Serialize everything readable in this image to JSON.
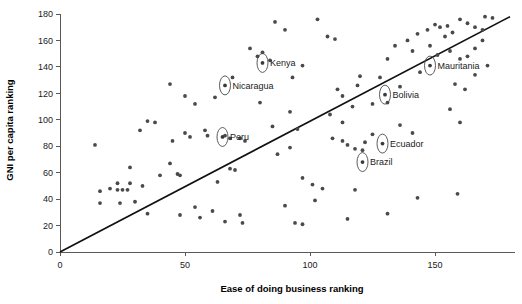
{
  "chart_data": {
    "type": "scatter",
    "title": "",
    "xlabel": "Ease of doing business ranking",
    "ylabel": "GNI per capita ranking",
    "xlim": [
      0,
      182
    ],
    "ylim": [
      0,
      180
    ],
    "xticks": [
      0,
      50,
      100,
      150
    ],
    "yticks": [
      0,
      20,
      40,
      60,
      80,
      100,
      120,
      140,
      160,
      180
    ],
    "grid": false,
    "legend": null,
    "marker_color": "#4a4a4a",
    "trendline": {
      "type": "linear",
      "x": [
        0,
        180
      ],
      "y": [
        0,
        178
      ],
      "color": "#111111"
    },
    "annotations": [
      {
        "label": "Kenya",
        "x": 81,
        "y": 143,
        "label_side": "right"
      },
      {
        "label": "Nicaragua",
        "x": 66,
        "y": 126,
        "label_side": "right"
      },
      {
        "label": "Peru",
        "x": 65,
        "y": 87,
        "label_side": "right"
      },
      {
        "label": "Mauritania",
        "x": 148,
        "y": 141,
        "label_side": "right"
      },
      {
        "label": "Bolivia",
        "x": 130,
        "y": 119,
        "label_side": "right"
      },
      {
        "label": "Ecuador",
        "x": 129,
        "y": 82,
        "label_side": "right"
      },
      {
        "label": "Brazil",
        "x": 121,
        "y": 68,
        "label_side": "right"
      }
    ],
    "points": [
      {
        "x": 16,
        "y": 46
      },
      {
        "x": 16,
        "y": 37
      },
      {
        "x": 14,
        "y": 81
      },
      {
        "x": 20,
        "y": 48
      },
      {
        "x": 23,
        "y": 47
      },
      {
        "x": 25,
        "y": 47
      },
      {
        "x": 27,
        "y": 47
      },
      {
        "x": 23,
        "y": 52
      },
      {
        "x": 28,
        "y": 52
      },
      {
        "x": 33,
        "y": 50
      },
      {
        "x": 24,
        "y": 37
      },
      {
        "x": 30,
        "y": 38
      },
      {
        "x": 35,
        "y": 29
      },
      {
        "x": 28,
        "y": 64
      },
      {
        "x": 32,
        "y": 92
      },
      {
        "x": 35,
        "y": 99
      },
      {
        "x": 38,
        "y": 98
      },
      {
        "x": 40,
        "y": 58
      },
      {
        "x": 44,
        "y": 67
      },
      {
        "x": 45,
        "y": 84
      },
      {
        "x": 47,
        "y": 59
      },
      {
        "x": 48,
        "y": 58
      },
      {
        "x": 44,
        "y": 127
      },
      {
        "x": 50,
        "y": 90
      },
      {
        "x": 52,
        "y": 87
      },
      {
        "x": 50,
        "y": 118
      },
      {
        "x": 54,
        "y": 112
      },
      {
        "x": 48,
        "y": 28
      },
      {
        "x": 54,
        "y": 34
      },
      {
        "x": 56,
        "y": 26
      },
      {
        "x": 58,
        "y": 92
      },
      {
        "x": 59,
        "y": 88
      },
      {
        "x": 62,
        "y": 117
      },
      {
        "x": 61,
        "y": 31
      },
      {
        "x": 63,
        "y": 53
      },
      {
        "x": 68,
        "y": 63
      },
      {
        "x": 70,
        "y": 62
      },
      {
        "x": 66,
        "y": 88
      },
      {
        "x": 68,
        "y": 86
      },
      {
        "x": 69,
        "y": 132
      },
      {
        "x": 72,
        "y": 86
      },
      {
        "x": 74,
        "y": 84
      },
      {
        "x": 66,
        "y": 23
      },
      {
        "x": 72,
        "y": 28
      },
      {
        "x": 73,
        "y": 22
      },
      {
        "x": 76,
        "y": 154
      },
      {
        "x": 79,
        "y": 148
      },
      {
        "x": 81,
        "y": 151
      },
      {
        "x": 84,
        "y": 145
      },
      {
        "x": 86,
        "y": 174
      },
      {
        "x": 90,
        "y": 168
      },
      {
        "x": 93,
        "y": 132
      },
      {
        "x": 97,
        "y": 141
      },
      {
        "x": 80,
        "y": 113
      },
      {
        "x": 85,
        "y": 95
      },
      {
        "x": 92,
        "y": 106
      },
      {
        "x": 95,
        "y": 93
      },
      {
        "x": 87,
        "y": 74
      },
      {
        "x": 92,
        "y": 79
      },
      {
        "x": 97,
        "y": 56
      },
      {
        "x": 101,
        "y": 51
      },
      {
        "x": 105,
        "y": 48
      },
      {
        "x": 90,
        "y": 35
      },
      {
        "x": 94,
        "y": 22
      },
      {
        "x": 97,
        "y": 21
      },
      {
        "x": 102,
        "y": 39
      },
      {
        "x": 103,
        "y": 176
      },
      {
        "x": 107,
        "y": 163
      },
      {
        "x": 110,
        "y": 161
      },
      {
        "x": 111,
        "y": 123
      },
      {
        "x": 113,
        "y": 118
      },
      {
        "x": 108,
        "y": 104
      },
      {
        "x": 113,
        "y": 98
      },
      {
        "x": 117,
        "y": 110
      },
      {
        "x": 119,
        "y": 126
      },
      {
        "x": 120,
        "y": 133
      },
      {
        "x": 109,
        "y": 86
      },
      {
        "x": 113,
        "y": 84
      },
      {
        "x": 115,
        "y": 81
      },
      {
        "x": 118,
        "y": 78
      },
      {
        "x": 121,
        "y": 77
      },
      {
        "x": 122,
        "y": 83
      },
      {
        "x": 125,
        "y": 89
      },
      {
        "x": 118,
        "y": 47
      },
      {
        "x": 115,
        "y": 25
      },
      {
        "x": 125,
        "y": 112
      },
      {
        "x": 128,
        "y": 132
      },
      {
        "x": 131,
        "y": 146
      },
      {
        "x": 134,
        "y": 156
      },
      {
        "x": 131,
        "y": 113
      },
      {
        "x": 136,
        "y": 125
      },
      {
        "x": 139,
        "y": 160
      },
      {
        "x": 141,
        "y": 152
      },
      {
        "x": 143,
        "y": 165
      },
      {
        "x": 144,
        "y": 136
      },
      {
        "x": 147,
        "y": 168
      },
      {
        "x": 150,
        "y": 172
      },
      {
        "x": 152,
        "y": 170
      },
      {
        "x": 155,
        "y": 171
      },
      {
        "x": 154,
        "y": 163
      },
      {
        "x": 157,
        "y": 166
      },
      {
        "x": 160,
        "y": 176
      },
      {
        "x": 163,
        "y": 173
      },
      {
        "x": 166,
        "y": 170
      },
      {
        "x": 169,
        "y": 168
      },
      {
        "x": 170,
        "y": 178
      },
      {
        "x": 173,
        "y": 177
      },
      {
        "x": 148,
        "y": 156
      },
      {
        "x": 151,
        "y": 149
      },
      {
        "x": 156,
        "y": 152
      },
      {
        "x": 160,
        "y": 146
      },
      {
        "x": 163,
        "y": 148
      },
      {
        "x": 166,
        "y": 154
      },
      {
        "x": 169,
        "y": 160
      },
      {
        "x": 158,
        "y": 127
      },
      {
        "x": 162,
        "y": 123
      },
      {
        "x": 166,
        "y": 134
      },
      {
        "x": 171,
        "y": 141
      },
      {
        "x": 136,
        "y": 96
      },
      {
        "x": 141,
        "y": 90
      },
      {
        "x": 156,
        "y": 108
      },
      {
        "x": 160,
        "y": 98
      },
      {
        "x": 143,
        "y": 41
      },
      {
        "x": 159,
        "y": 44
      },
      {
        "x": 131,
        "y": 29
      }
    ]
  }
}
